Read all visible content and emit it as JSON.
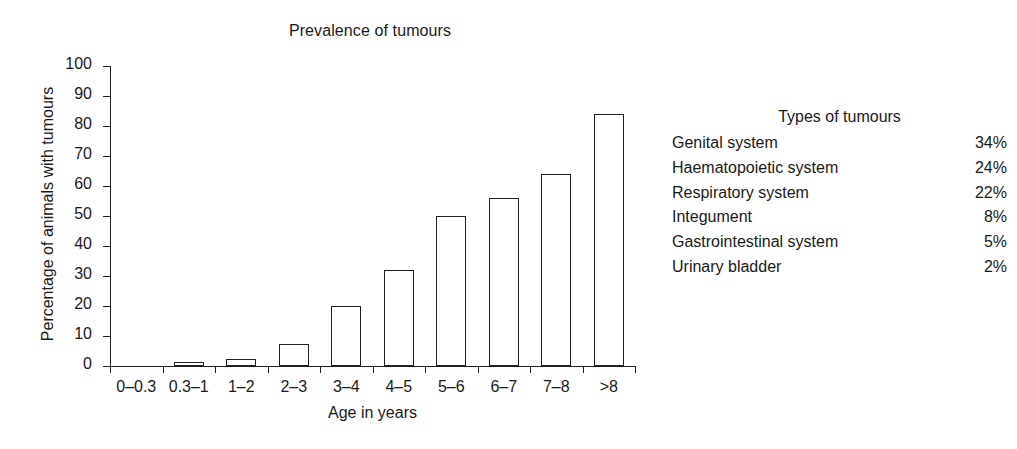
{
  "chart_data": {
    "type": "bar",
    "title": "Prevalence of tumours",
    "xlabel": "Age in years",
    "ylabel": "Percentage of animals with tumours",
    "categories": [
      "0–0.3",
      "0.3–1",
      "1–2",
      "2–3",
      "3–4",
      "4–5",
      "5–6",
      "6–7",
      "7–8",
      ">8"
    ],
    "values": [
      0,
      1.5,
      2.5,
      7.5,
      20,
      32,
      50,
      56,
      64,
      84
    ],
    "ylim": [
      0,
      100
    ],
    "yticks": [
      0,
      10,
      20,
      30,
      40,
      50,
      60,
      70,
      80,
      90,
      100
    ],
    "ytick_labels": [
      "0",
      "10",
      "20",
      "30",
      "40",
      "50",
      "60",
      "70",
      "80",
      "90",
      "100"
    ],
    "grid": false,
    "legend": "none",
    "bar_style": "outlined-white",
    "bar_color": "#ffffff",
    "bar_edge_color": "#1f1f1f",
    "axis_color": "#1f1f1f"
  },
  "types_panel": {
    "heading": "Types of tumours",
    "rows": [
      {
        "name": "Genital system",
        "value": "34%"
      },
      {
        "name": "Haematopoietic system",
        "value": "24%"
      },
      {
        "name": "Respiratory system",
        "value": "22%"
      },
      {
        "name": "Integument",
        "value": "8%"
      },
      {
        "name": "Gastrointestinal system",
        "value": "5%"
      },
      {
        "name": "Urinary bladder",
        "value": "2%"
      }
    ]
  }
}
